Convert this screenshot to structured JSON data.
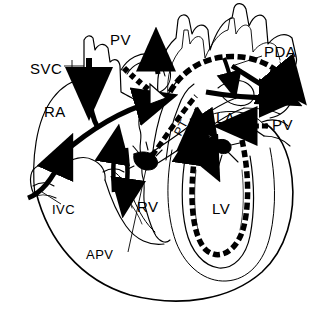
{
  "figure": {
    "ink_color": "#000000",
    "background_color": "#ffffff"
  },
  "labels": {
    "svc": "SVC",
    "ra": "RA",
    "ivc": "IVC",
    "apv": "APV",
    "rv": "RV",
    "pv_top": "PV",
    "pv_right": "PV",
    "pt": "PT",
    "la": "LA",
    "lv": "LV",
    "pda": "PDA"
  },
  "label_list": [
    {
      "key": "svc",
      "text": "SVC",
      "x": 30,
      "y": 68,
      "has_leader": true,
      "note": "superior vena cava"
    },
    {
      "key": "ra",
      "text": "RA",
      "x": 44,
      "y": 112,
      "has_leader": false,
      "note": "right atrium"
    },
    {
      "key": "ivc",
      "text": "IVC",
      "x": 52,
      "y": 209,
      "has_leader": true,
      "note": "inferior vena cava"
    },
    {
      "key": "apv",
      "text": "APV",
      "x": 90,
      "y": 255,
      "has_leader": true,
      "note": "absent pulmonary valve"
    },
    {
      "key": "rv",
      "text": "RV",
      "x": 137,
      "y": 205,
      "has_leader": false,
      "note": "right ventricle"
    },
    {
      "key": "pv_top",
      "text": "PV",
      "x": 112,
      "y": 39,
      "has_leader": false,
      "note": "pulmonary vein"
    },
    {
      "key": "pt",
      "text": "PT",
      "x": 168,
      "y": 128,
      "has_leader": false,
      "note": "pulmonary trunk, rotated"
    },
    {
      "key": "la",
      "text": "LA",
      "x": 219,
      "y": 117,
      "has_leader": false,
      "note": "left atrium"
    },
    {
      "key": "pv_right",
      "text": "PV",
      "x": 273,
      "y": 124,
      "has_leader": false,
      "note": "pulmonary vein"
    },
    {
      "key": "lv",
      "text": "LV",
      "x": 215,
      "y": 208,
      "has_leader": false,
      "note": "left ventricle"
    },
    {
      "key": "pda",
      "text": "PDA",
      "x": 265,
      "y": 51,
      "has_leader": true,
      "note": "patent ductus arteriosus"
    }
  ],
  "flow_arrows": [
    {
      "name": "svc-inflow-arrow",
      "style": "solid-black",
      "direction": "down",
      "region": "superior vena cava into right atrium"
    },
    {
      "name": "ivc-inflow-arrow",
      "style": "solid-black",
      "direction": "up-right",
      "region": "inferior vena cava into right atrium"
    },
    {
      "name": "ra-to-rv-arrow",
      "style": "solid-black",
      "direction": "down-right",
      "region": "right atrium to right ventricle"
    },
    {
      "name": "rv-outflow-arrow",
      "style": "solid-black",
      "direction": "down",
      "region": "right ventricle outflow"
    },
    {
      "name": "rv-regurgitation-arrow",
      "style": "solid-black",
      "direction": "up",
      "region": "pulmonary regurgitation into right ventricle"
    },
    {
      "name": "pt-to-pda-arrow",
      "style": "dotted-black",
      "direction": "right",
      "region": "pulmonary trunk through ductus to aorta"
    },
    {
      "name": "aortic-arch-arrow",
      "style": "dotted-black",
      "direction": "right",
      "region": "aortic arch"
    },
    {
      "name": "pda-descending-arrow",
      "style": "solid-black",
      "direction": "down-right",
      "region": "descending aorta"
    },
    {
      "name": "pv-top-return-arrow",
      "style": "dashed-hollow",
      "direction": "down-right",
      "region": "pulmonary vein return, upper"
    },
    {
      "name": "pv-right-return-arrow",
      "style": "dotted-black",
      "direction": "left",
      "region": "pulmonary vein return, right"
    },
    {
      "name": "la-to-lv-arrow",
      "style": "dotted-black",
      "direction": "down",
      "region": "left atrium to left ventricle"
    },
    {
      "name": "lv-outflow-arrow",
      "style": "dotted-black",
      "direction": "up",
      "region": "left ventricle outflow to aorta"
    },
    {
      "name": "ascending-aorta-arrow",
      "style": "solid-black",
      "direction": "up",
      "region": "ascending aorta"
    }
  ]
}
